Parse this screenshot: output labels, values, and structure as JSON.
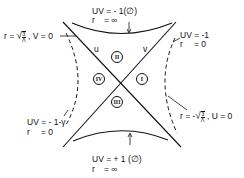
{
  "diagram": {
    "colors": {
      "ink": "#111111",
      "background": "#ffffff"
    },
    "axes": {
      "u_label": "u",
      "v_label": "v"
    },
    "regions": [
      {
        "id": "II",
        "label": "II",
        "position": "top"
      },
      {
        "id": "IV",
        "label": "IV",
        "position": "left"
      },
      {
        "id": "I",
        "label": "I",
        "position": "right"
      },
      {
        "id": "III",
        "label": "III",
        "position": "bottom"
      }
    ],
    "annotations": {
      "top_line1": "UV = - 1(∅)",
      "top_line2_r": "r",
      "top_line2_val": "= ∞",
      "right_top_line1": "UV = -1",
      "right_top_line2_r": "r",
      "right_top_line2_val": "= 0",
      "left_top": "r = √(3/Λ) , V = 0",
      "left_top_r": "r =",
      "left_top_sqrt_num": "3",
      "left_top_sqrt_den": "Λ",
      "left_top_tail": ", V = 0",
      "left_bottom_line1": "UV = - 1-γ",
      "left_bottom_line2_r": "r",
      "left_bottom_line2_val": "= 0",
      "right_bottom": "r = -√(3/Λ) , U = 0",
      "right_bottom_r": "r = -",
      "right_bottom_sqrt_num": "3",
      "right_bottom_sqrt_den": "Λ",
      "right_bottom_tail": ", U = 0",
      "bottom_line1": "UV = + 1 (∅)",
      "bottom_line2_r": "r",
      "bottom_line2_val": "= ∞"
    }
  }
}
